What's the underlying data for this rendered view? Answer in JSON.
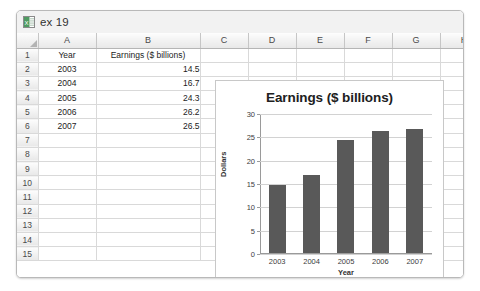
{
  "window": {
    "title": "ex 19",
    "icon": "excel-workbook-icon"
  },
  "sheet": {
    "column_headers": [
      "A",
      "B",
      "C",
      "D",
      "E",
      "F",
      "G",
      "H"
    ],
    "row_numbers": [
      "1",
      "2",
      "3",
      "4",
      "5",
      "6",
      "7",
      "8",
      "9",
      "10",
      "11",
      "12",
      "13",
      "14",
      "15"
    ],
    "cells": {
      "A1": "Year",
      "B1": "Earnings ($ billions)",
      "A2": "2003",
      "B2": "14.5",
      "A3": "2004",
      "B3": "16.7",
      "A4": "2005",
      "B4": "24.3",
      "A5": "2006",
      "B5": "26.2",
      "A6": "2007",
      "B6": "26.5"
    }
  },
  "chart_data": {
    "type": "bar",
    "title": "Earnings ($ billions)",
    "categories": [
      "2003",
      "2004",
      "2005",
      "2006",
      "2007"
    ],
    "values": [
      14.5,
      16.7,
      24.3,
      26.2,
      26.5
    ],
    "xlabel": "Year",
    "ylabel": "Dollars",
    "ylim": [
      0,
      30
    ],
    "yticks": [
      0,
      5,
      10,
      15,
      20,
      25,
      30
    ],
    "ytick_labels": [
      "0",
      "5",
      "10",
      "15",
      "20",
      "25",
      "30"
    ],
    "grid": true,
    "legend": false,
    "bar_color": "#595959"
  }
}
